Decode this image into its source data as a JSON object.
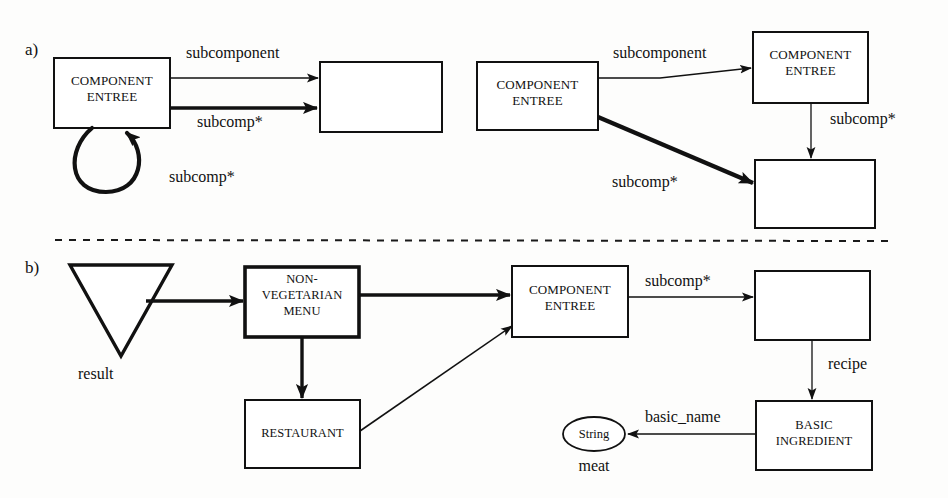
{
  "figure": {
    "sections": [
      {
        "id": "a",
        "label": "a)"
      },
      {
        "id": "b",
        "label": "b)"
      }
    ]
  },
  "colors": {
    "ink": "#111111",
    "paper": "#fdfdfc",
    "divider": "#1a1a1a"
  },
  "section_a": {
    "left_diagram": {
      "nodes": [
        {
          "id": "a-left-component-entree",
          "line1": "COMPONENT",
          "line2": "ENTREE",
          "shape": "rectangle",
          "empty": false
        },
        {
          "id": "a-left-target",
          "line1": "",
          "line2": "",
          "shape": "rectangle",
          "empty": true
        }
      ],
      "edges": [
        {
          "id": "a-left-subcomponent",
          "label": "subcomponent",
          "style": "thin"
        },
        {
          "id": "a-left-subcomp-star",
          "label": "subcomp*",
          "style": "thick"
        },
        {
          "id": "a-left-selfloop-subcomp-star",
          "label": "subcomp*",
          "style": "thick-loop"
        }
      ]
    },
    "right_diagram": {
      "nodes": [
        {
          "id": "a-right-component-entree-source",
          "line1": "COMPONENT",
          "line2": "ENTREE",
          "shape": "rectangle",
          "empty": false
        },
        {
          "id": "a-right-component-entree-target",
          "line1": "COMPONENT",
          "line2": "ENTREE",
          "shape": "rectangle",
          "empty": false
        },
        {
          "id": "a-right-empty",
          "line1": "",
          "line2": "",
          "shape": "rectangle",
          "empty": true
        }
      ],
      "edges": [
        {
          "id": "a-right-subcomponent",
          "label": "subcomponent",
          "style": "thin"
        },
        {
          "id": "a-right-subcomp-star-vertical",
          "label": "subcomp*",
          "style": "thin"
        },
        {
          "id": "a-right-subcomp-star-diagonal",
          "label": "subcomp*",
          "style": "thick"
        }
      ]
    }
  },
  "section_b": {
    "nodes": [
      {
        "id": "b-result-triangle",
        "label": "result",
        "shape": "triangle"
      },
      {
        "id": "b-non-vegetarian-menu",
        "line1": "NON-",
        "line2": "VEGETARIAN",
        "line3": "MENU",
        "shape": "rectangle-thick"
      },
      {
        "id": "b-restaurant",
        "line1": "RESTAURANT",
        "shape": "rectangle"
      },
      {
        "id": "b-component-entree",
        "line1": "COMPONENT",
        "line2": "ENTREE",
        "shape": "rectangle"
      },
      {
        "id": "b-empty",
        "line1": "",
        "shape": "rectangle",
        "empty": true
      },
      {
        "id": "b-basic-ingredient",
        "line1": "BASIC",
        "line2": "INGREDIENT",
        "shape": "rectangle"
      },
      {
        "id": "b-string-value",
        "label": "String",
        "caption": "meat",
        "shape": "ellipse"
      }
    ],
    "edges": [
      {
        "id": "b-result-to-menu",
        "label": "",
        "style": "thick"
      },
      {
        "id": "b-menu-to-component",
        "label": "",
        "style": "thick"
      },
      {
        "id": "b-menu-to-restaurant",
        "label": "",
        "style": "thick"
      },
      {
        "id": "b-restaurant-to-component",
        "label": "",
        "style": "thin"
      },
      {
        "id": "b-component-to-empty",
        "label": "subcomp*",
        "style": "thin"
      },
      {
        "id": "b-empty-to-basic-ingredient",
        "label": "recipe",
        "style": "thin"
      },
      {
        "id": "b-basic-ingredient-to-string",
        "label": "basic_name",
        "style": "thin"
      }
    ]
  },
  "labels": {
    "section_a": "a)",
    "section_b": "b)",
    "subcomponent": "subcomponent",
    "subcomp_star": "subcomp*",
    "component": "COMPONENT",
    "entree": "ENTREE",
    "non": "NON-",
    "vegetarian": "VEGETARIAN",
    "menu": "MENU",
    "restaurant": "RESTAURANT",
    "result": "result",
    "recipe": "recipe",
    "basic_name": "basic_name",
    "basic": "BASIC",
    "ingredient": "INGREDIENT",
    "string": "String",
    "meat": "meat"
  }
}
